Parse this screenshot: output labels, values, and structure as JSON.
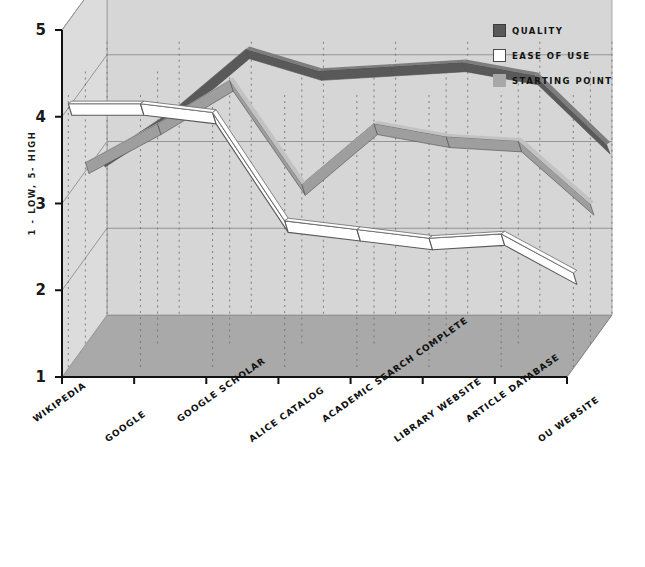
{
  "chart_data": {
    "type": "line",
    "title": "",
    "subtitle": "",
    "xlabel": "",
    "ylabel": "1 - LOW, 5- HIGH",
    "ylim": [
      1,
      5
    ],
    "yticks": [
      1,
      2,
      3,
      4,
      5
    ],
    "grid": true,
    "projection": "3d-ribbon",
    "legend_position": "top-right",
    "categories": [
      "WIKIPEDIA",
      "GOOGLE",
      "GOOGLE SCHOLAR",
      "ALICE CATALOG",
      "ACADEMIC SEARCH COMPLETE",
      "LIBRARY WEBSITE",
      "ARTICLE DATABASE",
      "OU WEBSITE"
    ],
    "series": [
      {
        "name": "QUALITY",
        "color": "#595959",
        "values": [
          2.9,
          3.45,
          4.15,
          3.9,
          3.95,
          4.0,
          3.85,
          3.05
        ]
      },
      {
        "name": "EASE OF USE",
        "color": "#ffffff",
        "values": [
          4.05,
          4.05,
          3.95,
          2.7,
          2.6,
          2.5,
          2.55,
          2.1
        ]
      },
      {
        "name": "STARTING POINT",
        "color": "#9e9e9e",
        "values": [
          3.1,
          3.55,
          4.05,
          2.85,
          3.55,
          3.4,
          3.35,
          2.62
        ]
      }
    ]
  },
  "legend": {
    "items": [
      {
        "label": "QUALITY",
        "swatch": "#595959",
        "border": "#3c3c3c"
      },
      {
        "label": "EASE OF USE",
        "swatch": "#ffffff",
        "border": "#4a4a4a"
      },
      {
        "label": "STARTING POINT",
        "swatch": "#a8a8a8",
        "border": "#a8a8a8"
      }
    ]
  },
  "axes": {
    "y_title": "1 - LOW, 5- HIGH",
    "y_tick_labels": [
      "5",
      "4",
      "3",
      "2",
      "1"
    ]
  },
  "colors": {
    "back_wall": "#d6d6d6",
    "side_wall": "#dcdcdc",
    "floor": "#a9a9a9",
    "axis_line": "#111111",
    "grid_line": "#8d8d8d",
    "drop_line": "#6f6f6f",
    "background": "#ffffff"
  }
}
